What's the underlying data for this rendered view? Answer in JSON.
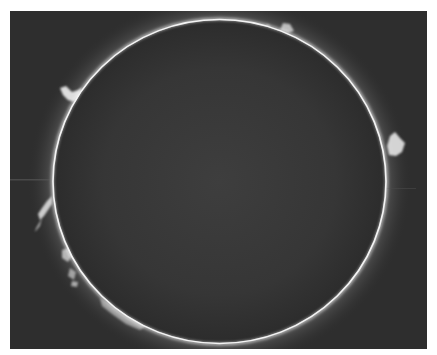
{
  "image": {
    "subject": "Solar disk with limb prominences",
    "alt": "Sun photographed in H-alpha showing a dark disk with a bright limb and prominences around the edge"
  },
  "colors": {
    "background": "#2e2e2e",
    "disk_center": "#3c3c3c",
    "disk_edge": "#2f2f2f",
    "limb": "#f2f2f2",
    "glow": "#bdbdbd",
    "border": "#ffffff"
  },
  "disk": {
    "cx": 219.5,
    "cy": 181.5,
    "rx": 166,
    "ry": 161.5
  },
  "prominences": [
    {
      "name": "upper-left",
      "x": 70,
      "y": 92
    },
    {
      "name": "upper-right-top",
      "x": 285,
      "y": 28
    },
    {
      "name": "right",
      "x": 397,
      "y": 143
    },
    {
      "name": "left-mid",
      "x": 44,
      "y": 210
    },
    {
      "name": "lower-left",
      "x": 70,
      "y": 265
    },
    {
      "name": "bottom-left",
      "x": 125,
      "y": 320
    }
  ]
}
